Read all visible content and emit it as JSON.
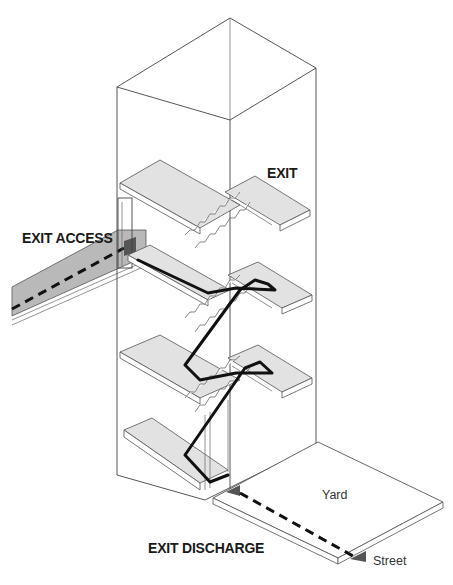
{
  "diagram": {
    "labels": {
      "exit_access": "EXIT ACCESS",
      "exit": "EXIT",
      "exit_discharge": "EXIT DISCHARGE",
      "yard": "Yard",
      "street": "Street"
    },
    "components": [
      {
        "id": "exit-access-corridor",
        "label": "EXIT ACCESS",
        "type": "corridor"
      },
      {
        "id": "exit-stair-enclosure",
        "label": "EXIT",
        "type": "stair-tower",
        "floors": 4
      },
      {
        "id": "exit-discharge-yard",
        "label": "EXIT DISCHARGE",
        "type": "yard"
      }
    ],
    "egress_path": [
      "EXIT ACCESS",
      "EXIT",
      "EXIT DISCHARGE",
      "Street"
    ],
    "colors": {
      "line": "#444444",
      "slab_fill": "#e2e2e2",
      "corridor_fill": "#b9b9b9",
      "path": "#111111",
      "marker": "#555555",
      "background": "#ffffff"
    }
  }
}
